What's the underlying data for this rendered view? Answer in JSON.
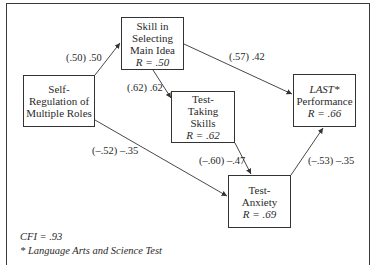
{
  "diagram": {
    "nodes": [
      {
        "id": "self_reg",
        "lines": [
          "Self-",
          "Regulation of",
          "Multiple Roles"
        ],
        "r": ""
      },
      {
        "id": "skill_main_idea",
        "lines": [
          "Skill in",
          "Selecting",
          "Main Idea"
        ],
        "r": "R = .50"
      },
      {
        "id": "test_taking",
        "lines": [
          "Test-",
          "Taking",
          "Skills"
        ],
        "r": "R = .62"
      },
      {
        "id": "last_perf",
        "lines": [
          "LAST*",
          "Performance"
        ],
        "r": "R = .66"
      },
      {
        "id": "test_anxiety",
        "lines": [
          "Test-",
          "Anxiety"
        ],
        "r": "R = .69"
      }
    ],
    "edges": [
      {
        "from": "self_reg",
        "to": "skill_main_idea",
        "label": "(.50) .50"
      },
      {
        "from": "skill_main_idea",
        "to": "test_taking",
        "label": "(.62) .62"
      },
      {
        "from": "skill_main_idea",
        "to": "last_perf",
        "label": "(.57) .42"
      },
      {
        "from": "self_reg",
        "to": "test_anxiety",
        "label": "(–.52) –.35"
      },
      {
        "from": "test_taking",
        "to": "test_anxiety",
        "label": "(–.60) –.47"
      },
      {
        "from": "test_anxiety",
        "to": "last_perf",
        "label": "(–.53) –.35"
      }
    ]
  },
  "footer": {
    "fit": "CFI = .93",
    "footnote": "* Language Arts and Science Test"
  },
  "colors": {
    "line": "#333333",
    "text": "#2a2a2a"
  }
}
